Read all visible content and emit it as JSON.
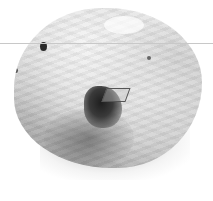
{
  "image": {
    "subject": "rock specimen",
    "description": "Grayscale photograph of a rough, whitish mineral/rock specimen with a dark cavity containing crystals, casting a soft shadow on a white background",
    "background_color": "#ffffff",
    "rock_base_color": "#e0e0e0",
    "cavity_color": "#1e1e1e",
    "guide_line_color": "#c8c8c8"
  }
}
